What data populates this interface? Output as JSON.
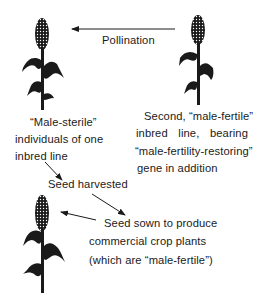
{
  "diagram": {
    "labels": {
      "pollination": "Pollination",
      "male_sterile": [
        "“Male-sterile”",
        "individuals of one",
        "inbred line"
      ],
      "male_fertile": [
        "Second, “male-fertile”",
        "inbred line, bearing",
        "“male-fertility-restoring”",
        "gene in addition"
      ],
      "seed_harvested": "Seed harvested",
      "seed_sown": [
        "Seed sown to produce",
        "commercial crop plants",
        "(which are “male-fertile”)"
      ]
    },
    "nodes": [
      {
        "id": "male-sterile-plant",
        "icon": "plant-silhouette-icon"
      },
      {
        "id": "male-fertile-plant",
        "icon": "plant-silhouette-icon"
      },
      {
        "id": "commercial-crop-plant",
        "icon": "plant-silhouette-icon"
      }
    ],
    "edges": [
      {
        "from": "male-fertile-plant",
        "to": "male-sterile-plant",
        "label": "Pollination"
      },
      {
        "from": "male-sterile-plant",
        "to": "seed-harvested"
      },
      {
        "from": "seed-harvested",
        "to": "seed-sown"
      },
      {
        "from": "seed-sown",
        "to": "commercial-crop-plant"
      }
    ],
    "colors": {
      "ink": "#1a1a1a",
      "background": "#ffffff"
    }
  }
}
